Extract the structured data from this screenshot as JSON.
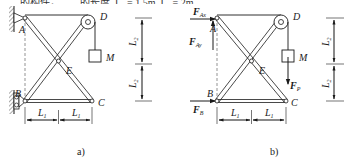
{
  "top_text_fragment": "……的构件，……的长度, L₁ = 1.5m, L₂ = 2m……",
  "panels": {
    "a": {
      "caption": "a)",
      "points": {
        "A": "A",
        "B": "B",
        "C": "C",
        "D": "D",
        "E": "E"
      },
      "mass": "M",
      "dims": {
        "h1": "L",
        "h1_sub": "1",
        "h2": "L",
        "h2_sub": "1",
        "v1": "L",
        "v1_sub": "2",
        "v2": "L",
        "v2_sub": "2"
      }
    },
    "b": {
      "caption": "b)",
      "points": {
        "A": "A",
        "B": "B",
        "C": "C",
        "D": "D",
        "E": "E"
      },
      "mass": "M",
      "forces": {
        "FAx": "F",
        "FAx_sub": "Ax",
        "FAy": "F",
        "FAy_sub": "Ay",
        "FB": "F",
        "FB_sub": "B",
        "FP": "F",
        "FP_sub": "P"
      },
      "dims": {
        "h1": "L",
        "h1_sub": "1",
        "h2": "L",
        "h2_sub": "1",
        "v1": "L",
        "v1_sub": "2",
        "v2": "L",
        "v2_sub": "2"
      }
    }
  },
  "colors": {
    "line": "#1a1a1a",
    "hatch": "#555555",
    "dash": "#666666"
  }
}
